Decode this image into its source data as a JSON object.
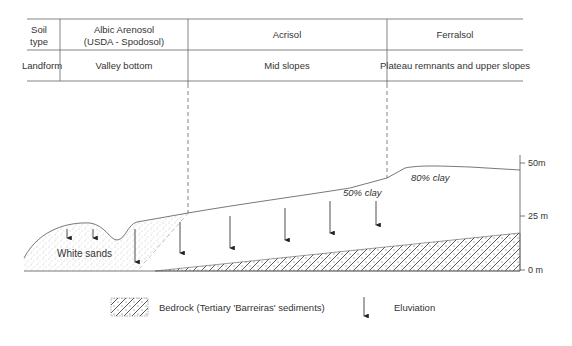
{
  "table": {
    "row_headers": [
      "Soil type",
      "Landform"
    ],
    "row_header_soil_line1": "Soil",
    "row_header_soil_line2": "type",
    "row_header_landform": "Landform",
    "columns": [
      {
        "soil_line1": "Albic Arenosol",
        "soil_line2": "(USDA - Spodosol)",
        "landform": "Valley bottom"
      },
      {
        "soil_line1": "Acrisol",
        "soil_line2": "",
        "landform": "Mid slopes"
      },
      {
        "soil_line1": "Ferralsol",
        "soil_line2": "",
        "landform": "Plateau remnants and upper slopes"
      }
    ]
  },
  "profile": {
    "labels": {
      "white_sands": "White sands",
      "clay_50": "50% clay",
      "clay_80": "80% clay"
    },
    "axis": {
      "ticks": [
        "50m",
        "25 m",
        "0 m"
      ]
    }
  },
  "legend": {
    "bedrock": "Bedrock (Tertiary 'Barreiras' sediments)",
    "eluviation": "Eluviation"
  },
  "colors": {
    "line": "#555555",
    "text": "#333333"
  }
}
